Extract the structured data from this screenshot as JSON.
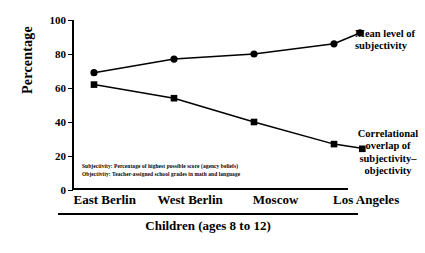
{
  "chart_data": {
    "type": "line",
    "title": "",
    "xlabel": "Children (ages 8 to 12)",
    "ylabel": "Percentage",
    "categories": [
      "East Berlin",
      "West Berlin",
      "Moscow",
      "Los Angeles"
    ],
    "ylim": [
      0,
      100
    ],
    "yticks": [
      0,
      20,
      40,
      60,
      80,
      100
    ],
    "grid": false,
    "legend_position": "right-inline-annotations",
    "series": [
      {
        "name": "Mean level of subjectivity",
        "marker": "circle",
        "values": [
          69,
          77,
          80,
          86
        ]
      },
      {
        "name": "Correlational overlap of subjectivity–objectivity",
        "marker": "square",
        "values": [
          62,
          54,
          40,
          27
        ]
      }
    ],
    "annotations": [
      "Subjectivity: Percentage of highest possible score (agency beliefs)",
      "Objectivity: Teacher-assigned school grades in math and language"
    ]
  },
  "axes": {
    "y_title": "Percentage",
    "y_tick_labels": [
      "100",
      "80",
      "60",
      "40",
      "20",
      "0"
    ]
  },
  "annotation_labels": {
    "top_line1": "Mean level of",
    "top_line2": "subjectivity",
    "bottom_line1": "Correlational",
    "bottom_line2": "overlap of",
    "bottom_line3": "subjectivity–",
    "bottom_line4": "objectivity"
  },
  "footnotes": {
    "subjectivity": "Subjectivity: Percentage of highest possible score (agency beliefs)",
    "objectivity": "Objectivity: Teacher-assigned school grades in math and language"
  },
  "caption": "Children (ages 8 to 12)",
  "colors": {
    "ink": "#000000",
    "background": "#ffffff"
  }
}
